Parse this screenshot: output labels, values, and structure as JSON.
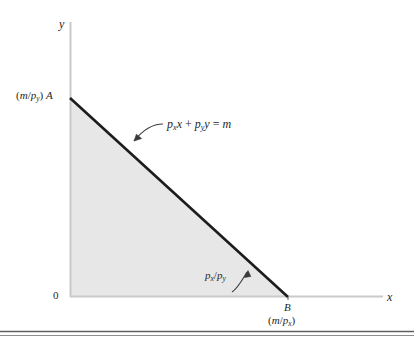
{
  "figure": {
    "type": "budget-constraint-diagram",
    "axes": {
      "y_axis_label": "y",
      "x_axis_label": "x",
      "origin_label": "0"
    },
    "labels": {
      "y_intercept": {
        "value_open": "(",
        "value_m": "m",
        "value_slash": "/",
        "value_p": "p",
        "value_sub": "y",
        "value_close": ")",
        "point": "A",
        "full_text": "(m/p_y) A"
      },
      "x_intercept": {
        "point": "B",
        "value_open": "(",
        "value_m": "m",
        "value_slash": "/",
        "value_p": "p",
        "value_sub": "x",
        "value_close": ")",
        "full_text": "B (m/p_x)"
      },
      "budget_equation": {
        "p1": "p",
        "p1_sub": "x",
        "var1": "x",
        "plus": "+",
        "p2": "p",
        "p2_sub": "y",
        "var2": "y",
        "equals": "=",
        "rhs": "m",
        "full_text": "p_x x + p_y y = m"
      },
      "slope": {
        "p1": "p",
        "p1_sub": "x",
        "slash": "/",
        "p2": "p",
        "p2_sub": "y",
        "full_text": "p_x/p_y"
      }
    },
    "colors": {
      "budget_line": "#1c1c1c",
      "feasible_region_fill": "#e7e7e7",
      "axis": "#c9c9c9",
      "text": "#262626",
      "rule": "#555555"
    },
    "geometry": {
      "y_axis_x": 70,
      "y_axis_top": 22,
      "x_axis_y": 297,
      "x_axis_right": 383,
      "intercept_a": [
        70,
        98
      ],
      "intercept_b": [
        288,
        297
      ]
    }
  }
}
